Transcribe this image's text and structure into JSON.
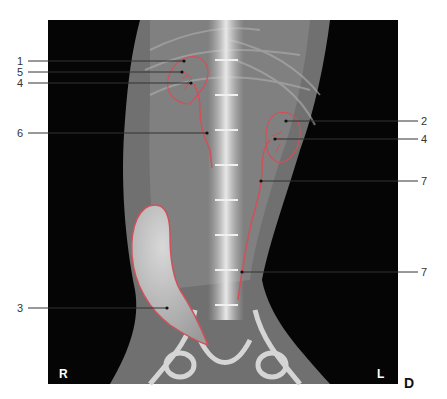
{
  "figure": {
    "type": "radiograph",
    "view_label": "D",
    "orientation": {
      "left_marker": "R",
      "right_marker": "L"
    },
    "outline_color": "#d0505a",
    "labels": [
      {
        "id": "1",
        "text": "1",
        "side": "left",
        "y": 61,
        "target": [
          184,
          61
        ]
      },
      {
        "id": "5",
        "text": "5",
        "side": "left",
        "y": 72,
        "target": [
          182,
          72
        ]
      },
      {
        "id": "4a",
        "text": "4",
        "side": "left",
        "y": 83,
        "target": [
          191,
          83
        ]
      },
      {
        "id": "6",
        "text": "6",
        "side": "left",
        "y": 133,
        "target": [
          207,
          133
        ]
      },
      {
        "id": "2",
        "text": "2",
        "side": "right",
        "y": 121,
        "target": [
          286,
          121
        ]
      },
      {
        "id": "4b",
        "text": "4",
        "side": "right",
        "y": 139,
        "target": [
          275,
          139
        ]
      },
      {
        "id": "7a",
        "text": "7",
        "side": "right",
        "y": 181,
        "target": [
          261,
          181
        ]
      },
      {
        "id": "7b",
        "text": "7",
        "side": "right",
        "y": 272,
        "target": [
          242,
          272
        ]
      },
      {
        "id": "3",
        "text": "3",
        "side": "left",
        "y": 308,
        "target": [
          167,
          308
        ]
      }
    ]
  }
}
